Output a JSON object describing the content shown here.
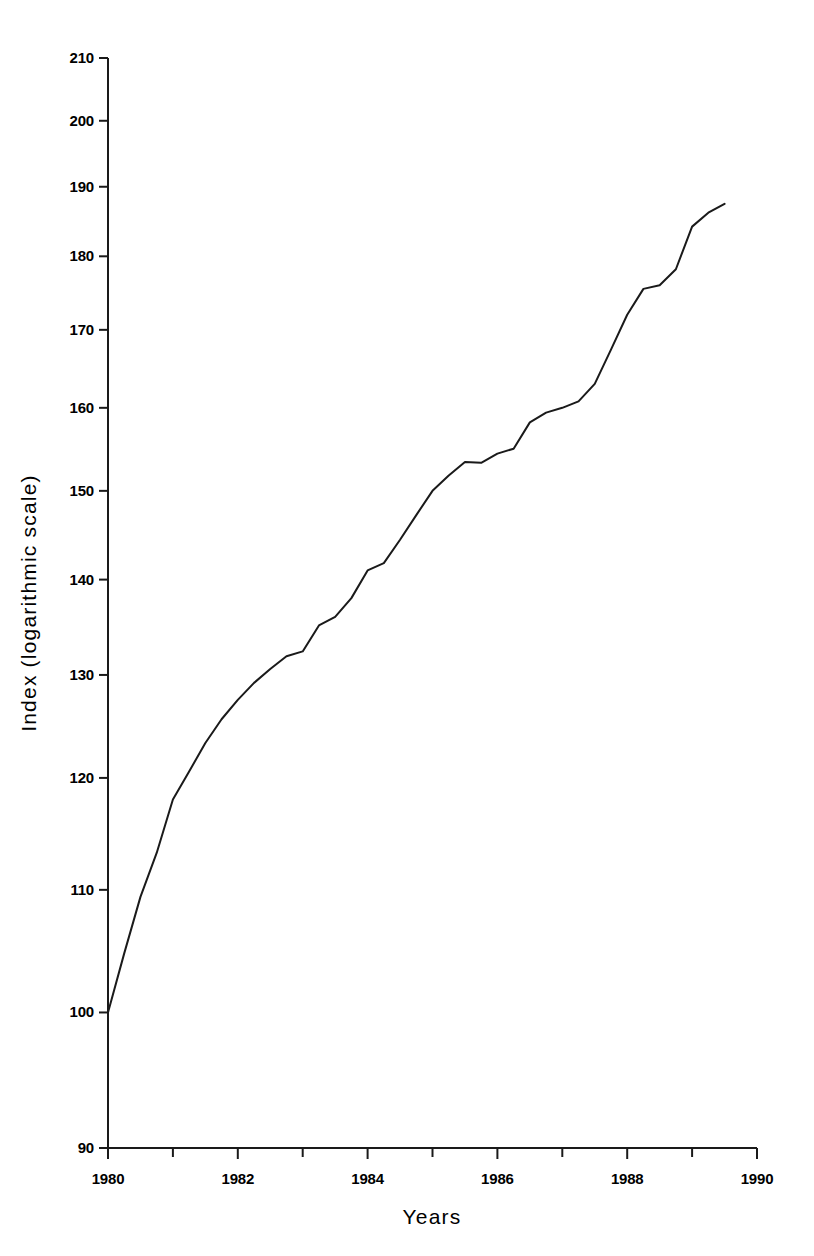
{
  "chart_data": {
    "type": "line",
    "title": "",
    "subtitle": "",
    "xlabel": "Years",
    "ylabel": "Index (logarithmic scale)",
    "yscale": "log",
    "xscale": "linear",
    "xlim": [
      1980,
      1990
    ],
    "ylim": [
      90,
      210
    ],
    "grid": false,
    "legend": false,
    "legend_position": "none",
    "x_tick_labels": [
      "1980",
      "1982",
      "1984",
      "1986",
      "1988",
      "1990"
    ],
    "x_tick_values": [
      1980,
      1982,
      1984,
      1986,
      1988,
      1990
    ],
    "x_minor_tick_values": [
      1981,
      1983,
      1985,
      1987,
      1989
    ],
    "y_tick_labels": [
      "90",
      "100",
      "110",
      "120",
      "130",
      "140",
      "150",
      "160",
      "170",
      "180",
      "190",
      "200",
      "210"
    ],
    "y_tick_values": [
      90,
      100,
      110,
      120,
      130,
      140,
      150,
      160,
      170,
      180,
      190,
      200,
      210
    ],
    "series": [
      {
        "name": "Index",
        "x": [
          1980.0,
          1980.25,
          1980.5,
          1980.75,
          1981.0,
          1981.25,
          1981.5,
          1981.75,
          1982.0,
          1982.25,
          1982.5,
          1982.75,
          1983.0,
          1983.25,
          1983.5,
          1983.75,
          1984.0,
          1984.25,
          1984.5,
          1984.75,
          1985.0,
          1985.25,
          1985.5,
          1985.75,
          1986.0,
          1986.25,
          1986.5,
          1986.75,
          1987.0,
          1987.25,
          1987.5,
          1987.75,
          1988.0,
          1988.25,
          1988.5,
          1988.75,
          1989.0,
          1989.25,
          1989.5
        ],
        "y": [
          100.0,
          104.7,
          109.4,
          113.2,
          118.0,
          120.6,
          123.3,
          125.6,
          127.5,
          129.2,
          130.6,
          131.9,
          132.4,
          135.1,
          136.0,
          138.0,
          141.0,
          141.8,
          144.4,
          147.2,
          150.0,
          151.8,
          153.4,
          153.3,
          154.4,
          155.0,
          158.2,
          159.4,
          160.0,
          160.8,
          163.0,
          167.4,
          172.0,
          175.5,
          176.0,
          178.2,
          184.2,
          186.2,
          187.5
        ]
      }
    ],
    "annotations": []
  },
  "axes": {
    "x_title": "Years",
    "y_title": "Index (logarithmic scale)"
  }
}
